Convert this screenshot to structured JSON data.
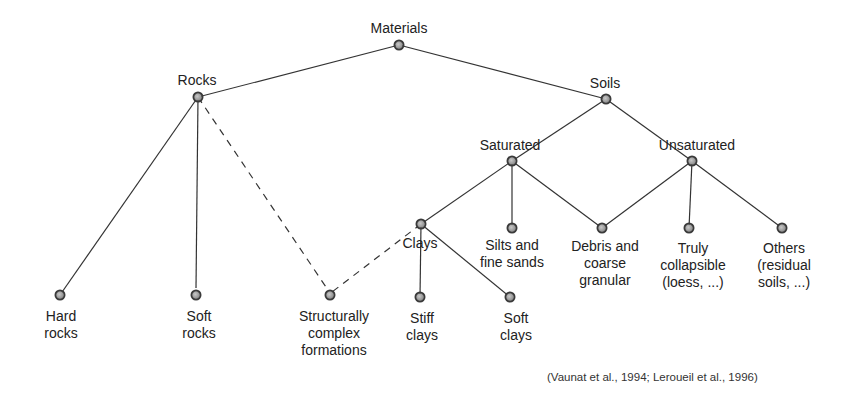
{
  "diagram": {
    "nodes": {
      "materials": {
        "label": "Materials"
      },
      "rocks": {
        "label": "Rocks"
      },
      "soils": {
        "label": "Soils"
      },
      "saturated": {
        "label": "Saturated"
      },
      "unsaturated": {
        "label": "Unsaturated"
      },
      "clays": {
        "label": "Clays"
      },
      "silts": {
        "label": "Silts and\nfine sands"
      },
      "debris": {
        "label": "Debris and\ncoarse\ngranular"
      },
      "truly_collapsible": {
        "label": "Truly\ncollapsible\n(loess, ...)"
      },
      "others": {
        "label": "Others\n(residual\nsoils, ...)"
      },
      "hard_rocks": {
        "label": "Hard\nrocks"
      },
      "soft_rocks": {
        "label": "Soft\nrocks"
      },
      "structurally_complex": {
        "label": "Structurally\ncomplex\nformations"
      },
      "stiff_clays": {
        "label": "Stiff\nclays"
      },
      "soft_clays": {
        "label": "Soft\nclays"
      }
    },
    "edges": [
      {
        "from": "materials",
        "to": "rocks",
        "style": "solid"
      },
      {
        "from": "materials",
        "to": "soils",
        "style": "solid"
      },
      {
        "from": "rocks",
        "to": "hard_rocks",
        "style": "solid"
      },
      {
        "from": "rocks",
        "to": "soft_rocks",
        "style": "solid"
      },
      {
        "from": "rocks",
        "to": "structurally_complex",
        "style": "dashed"
      },
      {
        "from": "clays",
        "to": "structurally_complex",
        "style": "dashed"
      },
      {
        "from": "soils",
        "to": "saturated",
        "style": "solid"
      },
      {
        "from": "soils",
        "to": "unsaturated",
        "style": "solid"
      },
      {
        "from": "saturated",
        "to": "clays",
        "style": "solid"
      },
      {
        "from": "saturated",
        "to": "silts",
        "style": "solid"
      },
      {
        "from": "saturated",
        "to": "debris",
        "style": "solid"
      },
      {
        "from": "unsaturated",
        "to": "debris",
        "style": "solid"
      },
      {
        "from": "unsaturated",
        "to": "truly_collapsible",
        "style": "solid"
      },
      {
        "from": "unsaturated",
        "to": "others",
        "style": "solid"
      },
      {
        "from": "clays",
        "to": "stiff_clays",
        "style": "solid"
      },
      {
        "from": "clays",
        "to": "soft_clays",
        "style": "solid"
      }
    ],
    "citation": "(Vaunat et al., 1994; Leroueil et al., 1996)"
  }
}
